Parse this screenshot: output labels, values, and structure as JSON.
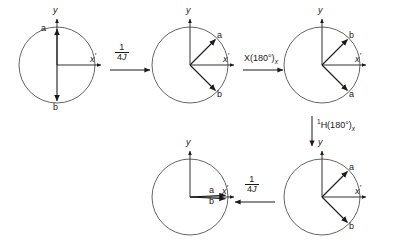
{
  "figure": {
    "stroke_color": "#1a1a1a",
    "circle_color": "#555555",
    "width": 398,
    "height": 250
  },
  "axis": {
    "y_label": "y",
    "x_label": "x",
    "x_prime": "′",
    "y_prime": ""
  },
  "vectors": {
    "a": "a",
    "b": "b"
  },
  "circles": [
    {
      "id": "circle-1",
      "cx": 57,
      "cy": 65,
      "r": 38,
      "y_axis_label": "y",
      "x_axis_label": "x",
      "vectors": [
        {
          "name": "a",
          "angle_deg": 90,
          "label": "a"
        },
        {
          "name": "b",
          "angle_deg": 270,
          "label": "b"
        }
      ]
    },
    {
      "id": "circle-2",
      "cx": 190,
      "cy": 65,
      "r": 38,
      "y_axis_label": "y",
      "x_axis_label": "x",
      "vectors": [
        {
          "name": "a",
          "angle_deg": 45,
          "label": "a"
        },
        {
          "name": "b",
          "angle_deg": -45,
          "label": "b"
        }
      ]
    },
    {
      "id": "circle-3",
      "cx": 322,
      "cy": 65,
      "r": 38,
      "y_axis_label": "y",
      "x_axis_label": "x",
      "vectors": [
        {
          "name": "b",
          "angle_deg": 45,
          "label": "b"
        },
        {
          "name": "a",
          "angle_deg": -45,
          "label": "a"
        }
      ]
    },
    {
      "id": "circle-4",
      "cx": 322,
      "cy": 197,
      "r": 38,
      "y_axis_label": "y",
      "x_axis_label": "x",
      "vectors": [
        {
          "name": "a",
          "angle_deg": 45,
          "label": "a"
        },
        {
          "name": "b",
          "angle_deg": -45,
          "label": "b"
        }
      ]
    },
    {
      "id": "circle-5",
      "cx": 190,
      "cy": 197,
      "r": 38,
      "y_axis_label": "y",
      "x_axis_label": "x",
      "vectors": [
        {
          "name": "a",
          "angle_deg": 3,
          "label": "a"
        },
        {
          "name": "b",
          "angle_deg": -3,
          "label": "b"
        }
      ]
    }
  ],
  "arrows": [
    {
      "id": "arrow-1",
      "direction": "right",
      "label_numerator": "1",
      "label_denominator_number": "4",
      "label_denominator_symbol": "J"
    },
    {
      "id": "arrow-2",
      "direction": "right",
      "label_main": "X(180°)",
      "label_subscript": "x"
    },
    {
      "id": "arrow-3",
      "direction": "down",
      "label_superscript": "1",
      "label_main": "H(180°)",
      "label_subscript": "x"
    },
    {
      "id": "arrow-4",
      "direction": "left",
      "label_numerator": "1",
      "label_denominator_number": "4",
      "label_denominator_symbol": "J"
    }
  ]
}
